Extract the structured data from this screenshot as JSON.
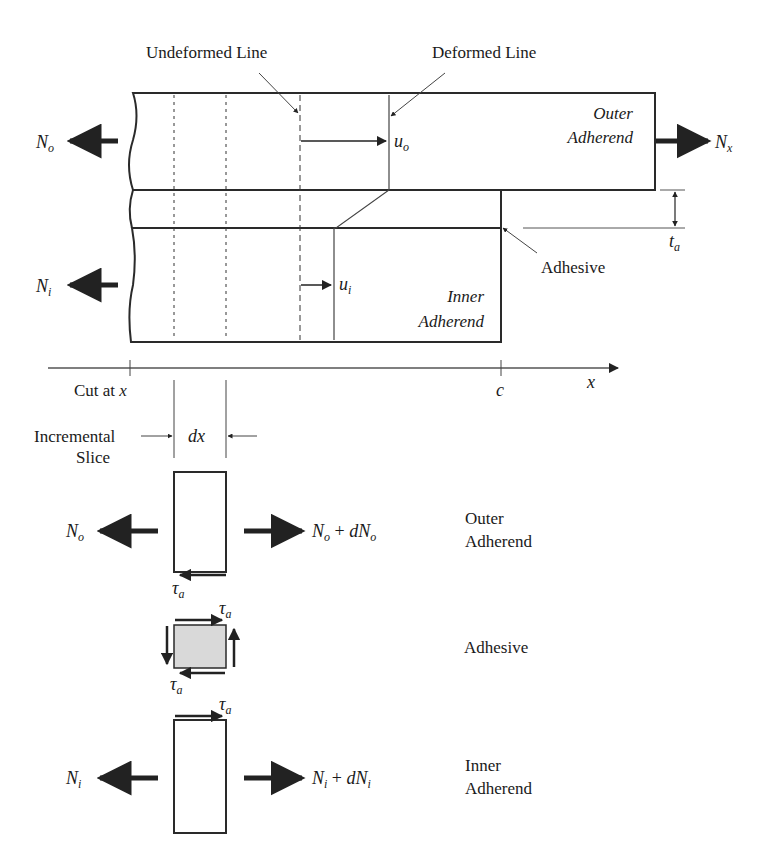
{
  "figure": {
    "type": "single-lap-joint shear-lag free body diagram",
    "top_labels": {
      "undeformed_line": "Undeformed Line",
      "deformed_line": "Deformed Line"
    },
    "joint": {
      "outer_adherend_line1": "Outer",
      "outer_adherend_line2": "Adherend",
      "inner_adherend_line1": "Inner",
      "inner_adherend_line2": "Adherend",
      "adhesive": "Adhesive",
      "adhesive_thickness": "t",
      "adhesive_thickness_sub": "a",
      "displacement_outer": "u",
      "displacement_outer_sub": "o",
      "displacement_inner": "u",
      "displacement_inner_sub": "i",
      "force_outer_left": "N",
      "force_outer_left_sub": "o",
      "force_inner_left": "N",
      "force_inner_left_sub": "i",
      "force_right": "N",
      "force_right_sub": "x"
    },
    "axis": {
      "label": "x",
      "cut_label_prefix": "Cut at ",
      "cut_label_var": "x",
      "end_label": "c"
    },
    "slice": {
      "label_line1": "Incremental",
      "label_line2": "Slice",
      "width_label": "dx"
    },
    "free_bodies": [
      {
        "name": "Outer Adherend",
        "label_line1": "Outer",
        "label_line2": "Adherend",
        "left_force": "N",
        "left_force_sub": "o",
        "right_force_a": "N",
        "right_force_a_sub": "o",
        "right_force_plus": " + ",
        "right_force_b": "dN",
        "right_force_b_sub": "o",
        "shear": "τ",
        "shear_sub": "a"
      },
      {
        "name": "Adhesive",
        "label_line1": "Adhesive",
        "shear_top": "τ",
        "shear_top_sub": "a",
        "shear_bottom": "τ",
        "shear_bottom_sub": "a",
        "fill_color": "#d9d9d9"
      },
      {
        "name": "Inner Adherend",
        "label_line1": "Inner",
        "label_line2": "Adherend",
        "left_force": "N",
        "left_force_sub": "i",
        "right_force_a": "N",
        "right_force_a_sub": "i",
        "right_force_plus": " + ",
        "right_force_b": "dN",
        "right_force_b_sub": "i",
        "shear": "τ",
        "shear_sub": "a"
      }
    ],
    "colors": {
      "line": "#2a2a2a",
      "adhesive_fill": "#d9d9d9",
      "background": "#ffffff"
    }
  }
}
